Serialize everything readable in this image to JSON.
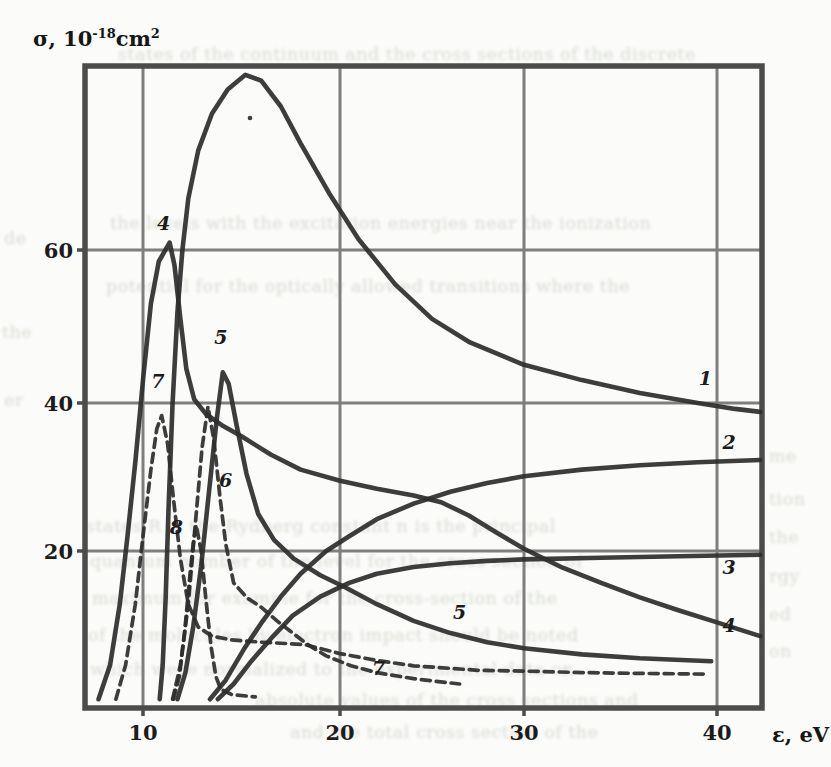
{
  "figure": {
    "y_axis_title": {
      "base": "σ, 10",
      "exp": "-18",
      "unit": "cm",
      "unit_exp": "2"
    },
    "x_axis_title": "ε, eV"
  },
  "chart_data": {
    "type": "line",
    "title": "",
    "xlabel": "ε, eV",
    "ylabel": "σ, 10^-18 cm^2",
    "xlim": [
      7,
      42.5
    ],
    "ylim": [
      0,
      85
    ],
    "grid": true,
    "x_ticks": [
      10,
      20,
      30,
      40
    ],
    "y_ticks": [
      20,
      40,
      60
    ],
    "frame": {
      "left": 85,
      "top": 66,
      "right": 762,
      "bottom": 708
    },
    "calibration": {
      "x": [
        [
          7,
          85
        ],
        [
          10,
          143
        ],
        [
          20,
          340
        ],
        [
          30,
          524
        ],
        [
          40,
          717
        ],
        [
          42.5,
          762
        ]
      ],
      "y": [
        [
          0,
          703
        ],
        [
          20,
          551
        ],
        [
          40,
          403
        ],
        [
          60,
          250
        ],
        [
          85,
          66
        ]
      ]
    },
    "colors": {
      "curve": "#2e2e2e",
      "grid": "#7f7f7f",
      "frame": "#4c4c4c"
    },
    "series": [
      {
        "name": "1",
        "dashed": false,
        "points": [
          [
            10.85,
            0.5
          ],
          [
            11.0,
            5
          ],
          [
            11.15,
            14
          ],
          [
            11.3,
            26
          ],
          [
            11.5,
            40
          ],
          [
            11.75,
            52
          ],
          [
            12.0,
            60
          ],
          [
            12.3,
            67
          ],
          [
            12.8,
            73.5
          ],
          [
            13.5,
            78.5
          ],
          [
            14.3,
            81.8
          ],
          [
            15.2,
            83.8
          ],
          [
            16.0,
            83
          ],
          [
            17.0,
            79.5
          ],
          [
            18.0,
            74.5
          ],
          [
            19.5,
            67.5
          ],
          [
            21,
            61.5
          ],
          [
            23,
            55.5
          ],
          [
            25,
            51
          ],
          [
            27,
            48
          ],
          [
            30,
            45
          ],
          [
            33,
            43
          ],
          [
            36,
            41.3
          ],
          [
            39,
            40
          ],
          [
            41,
            39.2
          ],
          [
            42.4,
            38.8
          ]
        ]
      },
      {
        "name": "2",
        "dashed": false,
        "points": [
          [
            13.4,
            0.5
          ],
          [
            14.2,
            3
          ],
          [
            15.1,
            7
          ],
          [
            16,
            10.5
          ],
          [
            17,
            14
          ],
          [
            18,
            17
          ],
          [
            19.3,
            20
          ],
          [
            20.5,
            22
          ],
          [
            22,
            24.3
          ],
          [
            24,
            26.4
          ],
          [
            26,
            28
          ],
          [
            28,
            29.2
          ],
          [
            30,
            30.1
          ],
          [
            33,
            31
          ],
          [
            36,
            31.6
          ],
          [
            39,
            32
          ],
          [
            42.4,
            32.3
          ]
        ]
      },
      {
        "name": "3",
        "dashed": false,
        "points": [
          [
            13.8,
            0.5
          ],
          [
            14.6,
            2.5
          ],
          [
            15.5,
            5.5
          ],
          [
            16.5,
            8.5
          ],
          [
            17.6,
            11.5
          ],
          [
            19,
            14
          ],
          [
            20.5,
            15.8
          ],
          [
            22,
            17
          ],
          [
            24,
            17.9
          ],
          [
            26,
            18.4
          ],
          [
            28,
            18.7
          ],
          [
            30,
            18.9
          ],
          [
            34,
            19.1
          ],
          [
            38,
            19.3
          ],
          [
            42.4,
            19.5
          ]
        ]
      },
      {
        "name": "4",
        "dashed": false,
        "points": [
          [
            7.7,
            0.5
          ],
          [
            8.3,
            5
          ],
          [
            8.8,
            13
          ],
          [
            9.2,
            22
          ],
          [
            9.6,
            32
          ],
          [
            10.0,
            43
          ],
          [
            10.4,
            53
          ],
          [
            10.8,
            58.5
          ],
          [
            11.35,
            61
          ],
          [
            11.6,
            58
          ],
          [
            11.9,
            51
          ],
          [
            12.2,
            44.5
          ],
          [
            12.6,
            40.5
          ],
          [
            13.2,
            38.5
          ],
          [
            14,
            37
          ],
          [
            15,
            35.5
          ],
          [
            16.5,
            33
          ],
          [
            18,
            31
          ],
          [
            20,
            29.5
          ],
          [
            22,
            28.4
          ],
          [
            24,
            27.5
          ],
          [
            25.5,
            26.6
          ],
          [
            27,
            24.8
          ],
          [
            28.5,
            22.5
          ],
          [
            30,
            20.3
          ],
          [
            32,
            17.8
          ],
          [
            34,
            15.8
          ],
          [
            36,
            13.9
          ],
          [
            38,
            12.2
          ],
          [
            40,
            10.6
          ],
          [
            42.4,
            8.8
          ]
        ]
      },
      {
        "name": "5",
        "dashed": false,
        "points": [
          [
            11.75,
            0.5
          ],
          [
            12.15,
            4
          ],
          [
            12.55,
            10
          ],
          [
            12.95,
            18
          ],
          [
            13.35,
            28
          ],
          [
            13.75,
            38
          ],
          [
            14.05,
            44
          ],
          [
            14.35,
            42.5
          ],
          [
            14.75,
            37
          ],
          [
            15.25,
            30.5
          ],
          [
            15.85,
            25
          ],
          [
            16.65,
            21.5
          ],
          [
            17.65,
            19
          ],
          [
            19,
            16.8
          ],
          [
            20.3,
            15.2
          ],
          [
            22,
            13
          ],
          [
            24,
            10.8
          ],
          [
            26,
            9.2
          ],
          [
            28,
            8
          ],
          [
            30,
            7.2
          ],
          [
            33,
            6.4
          ],
          [
            36,
            5.9
          ],
          [
            39.7,
            5.5
          ]
        ]
      },
      {
        "name": "6",
        "dashed": true,
        "points": [
          [
            11.5,
            0.5
          ],
          [
            11.9,
            5
          ],
          [
            12.3,
            13
          ],
          [
            12.7,
            25
          ],
          [
            13.0,
            34
          ],
          [
            13.3,
            39.5
          ],
          [
            13.6,
            35
          ],
          [
            13.9,
            27.5
          ],
          [
            14.2,
            21
          ],
          [
            14.6,
            15.8
          ],
          [
            15.3,
            13.8
          ],
          [
            16.0,
            12.6
          ],
          [
            16.8,
            10.8
          ],
          [
            17.4,
            9.6
          ],
          [
            18.3,
            7.8
          ],
          [
            19.3,
            6.2
          ],
          [
            20.6,
            4.9
          ],
          [
            22,
            4
          ],
          [
            24,
            3.2
          ],
          [
            26.5,
            2.5
          ]
        ]
      },
      {
        "name": "7",
        "dashed": true,
        "points": [
          [
            8.6,
            0.5
          ],
          [
            9.1,
            5
          ],
          [
            9.6,
            13
          ],
          [
            10.0,
            22
          ],
          [
            10.4,
            31
          ],
          [
            10.7,
            36.5
          ],
          [
            10.95,
            38.3
          ],
          [
            11.25,
            34.5
          ],
          [
            11.55,
            27
          ],
          [
            11.9,
            19
          ],
          [
            12.3,
            13
          ],
          [
            12.8,
            10
          ],
          [
            13.5,
            8.8
          ],
          [
            14.5,
            8.3
          ],
          [
            16,
            8
          ],
          [
            18.2,
            7.7
          ],
          [
            20,
            6.5
          ],
          [
            22,
            5.6
          ],
          [
            24,
            4.9
          ],
          [
            27.5,
            4.3
          ],
          [
            30,
            4.2
          ],
          [
            33,
            4.0
          ],
          [
            36,
            3.9
          ],
          [
            39.3,
            3.8
          ]
        ]
      },
      {
        "name": "8",
        "dashed": true,
        "points": [
          [
            11.55,
            0.5
          ],
          [
            11.85,
            3.5
          ],
          [
            12.1,
            9
          ],
          [
            12.35,
            16
          ],
          [
            12.55,
            21
          ],
          [
            12.7,
            23.5
          ],
          [
            12.95,
            20
          ],
          [
            13.2,
            13.5
          ],
          [
            13.45,
            7.5
          ],
          [
            13.7,
            3.5
          ],
          [
            13.95,
            1.8
          ],
          [
            14.5,
            1.1
          ],
          [
            15.7,
            0.8
          ]
        ]
      }
    ],
    "curve_labels": [
      {
        "text": "4",
        "eps": 11.05,
        "sigma": 62.7
      },
      {
        "text": "5",
        "eps": 13.95,
        "sigma": 47.7
      },
      {
        "text": "7",
        "eps": 10.75,
        "sigma": 42.0
      },
      {
        "text": "6",
        "eps": 14.2,
        "sigma": 28.6
      },
      {
        "text": "8",
        "eps": 11.7,
        "sigma": 22.3
      },
      {
        "text": "1",
        "eps": 39.4,
        "sigma": 42.4
      },
      {
        "text": "2",
        "eps": 40.67,
        "sigma": 33.8
      },
      {
        "text": "3",
        "eps": 40.67,
        "sigma": 17.0
      },
      {
        "text": "4",
        "eps": 40.67,
        "sigma": 9.3
      },
      {
        "text": "5",
        "eps": 26.5,
        "sigma": 11.0
      },
      {
        "text": "7",
        "eps": 22.1,
        "sigma": 3.7
      }
    ],
    "specks": [
      [
        250,
        118
      ]
    ]
  },
  "ghost_text": [
    {
      "x": 118,
      "y": 44,
      "t": "states of the continuum and the cross sections of the discrete"
    },
    {
      "x": 110,
      "y": 213,
      "t": "the levels with the excitation energies near the ionization"
    },
    {
      "x": 106,
      "y": 276,
      "t": "potential for the optically allowed transitions where the"
    },
    {
      "x": 86,
      "y": 516,
      "t": "states R is the Rydberg constant n is the principal"
    },
    {
      "x": 90,
      "y": 551,
      "t": "quantum number of the level for the cross section of"
    },
    {
      "x": 92,
      "y": 588,
      "t": "maximum for example for the cross-section of the"
    },
    {
      "x": 88,
      "y": 625,
      "t": "of the molecules by electron impact should be noted"
    },
    {
      "x": 90,
      "y": 659,
      "t": "which were normalized to the experimental data on"
    },
    {
      "x": 255,
      "y": 690,
      "t": "absolute values of the cross sections and"
    },
    {
      "x": 290,
      "y": 722,
      "t": "and the total cross section of the"
    },
    {
      "x": 769,
      "y": 446,
      "t": "me"
    },
    {
      "x": 769,
      "y": 489,
      "t": "tion"
    },
    {
      "x": 769,
      "y": 527,
      "t": "the"
    },
    {
      "x": 769,
      "y": 566,
      "t": "rgy"
    },
    {
      "x": 769,
      "y": 604,
      "t": "ed"
    },
    {
      "x": 769,
      "y": 641,
      "t": "on"
    },
    {
      "x": 4,
      "y": 228,
      "t": "de"
    },
    {
      "x": 2,
      "y": 322,
      "t": "the"
    },
    {
      "x": 4,
      "y": 390,
      "t": "er"
    }
  ]
}
